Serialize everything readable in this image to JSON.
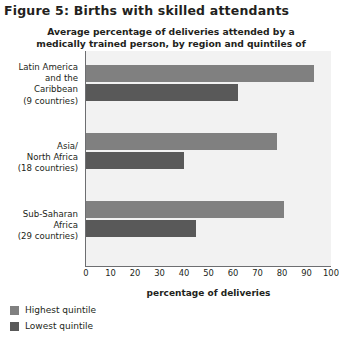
{
  "figure": {
    "title": "Figure 5: Births with skilled attendants"
  },
  "chart_data": {
    "type": "bar",
    "orientation": "horizontal",
    "title": "Average percentage of deliveries attended by a medically trained person, by region and quintiles of household wealth",
    "xlabel": "percentage of deliveries",
    "ylabel": "",
    "xlim": [
      0,
      100
    ],
    "xticks": [
      0,
      10,
      20,
      30,
      40,
      50,
      60,
      70,
      80,
      90,
      100
    ],
    "xtick_labels": [
      "0",
      "10",
      "20",
      "30",
      "40",
      "50",
      "60",
      "70",
      "80",
      "90",
      "100"
    ],
    "grid": false,
    "legend_position": "below-left",
    "categories": [
      "Latin America and the Caribbean (9 countries)",
      "Asia/ North Africa (18 countries)",
      "Sub-Saharan Africa (29 countries)"
    ],
    "category_lines": [
      [
        "Latin America",
        "and the",
        "Caribbean",
        "(9 countries)"
      ],
      [
        "Asia/",
        "North Africa",
        "(18 countries)"
      ],
      [
        "Sub-Saharan",
        "Africa",
        "(29 countries)"
      ]
    ],
    "series": [
      {
        "name": "Highest quintile",
        "color": "#808080",
        "values": [
          93,
          78,
          81
        ]
      },
      {
        "name": "Lowest quintile",
        "color": "#595959",
        "values": [
          62,
          40,
          45
        ]
      }
    ]
  },
  "legend": {
    "items": [
      {
        "label": "Highest quintile",
        "color": "#808080"
      },
      {
        "label": "Lowest quintile",
        "color": "#595959"
      }
    ]
  },
  "colors": {
    "highest_quintile": "#808080",
    "lowest_quintile": "#595959",
    "plot_background": "#f2f2f2",
    "axis": "#6d6e71",
    "text": "#231f20"
  }
}
